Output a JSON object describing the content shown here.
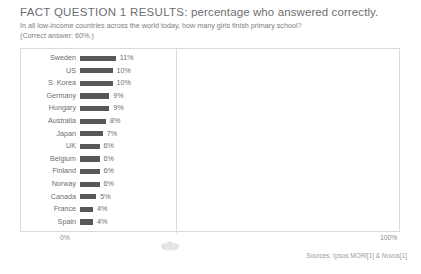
{
  "header": {
    "title_strong": "FACT QUESTION 1 RESULTS:",
    "title_rest": " percentage who answered correctly.",
    "subtitle": "In all low-income countries across the world today, how many girls finish primary school?",
    "note": "(Correct answer: 60%.)"
  },
  "axis": {
    "left_label": "0%",
    "right_label": "100%"
  },
  "footer": {
    "source": "Sources: Ipsos MORI[1] & Novus[1]"
  },
  "icons": {
    "watermark": "globe-watermark-icon"
  },
  "colors": {
    "bar": "#58585a",
    "frame": "#d9d9d9",
    "text": "#6d6e71"
  },
  "chart_data": {
    "type": "bar",
    "title": "FACT QUESTION 1 RESULTS: percentage who answered correctly.",
    "subtitle": "In all low-income countries across the world today, how many girls finish primary school?",
    "annotation": "(Correct answer: 60%.)",
    "orientation": "horizontal",
    "xlabel": "",
    "ylabel": "",
    "xlim": [
      0,
      100
    ],
    "xticks": [
      0,
      100
    ],
    "xticklabels": [
      "0%",
      "100%"
    ],
    "grid": false,
    "legend": null,
    "categories": [
      "Sweden",
      "US",
      "S. Korea",
      "Germany",
      "Hungary",
      "Australia",
      "Japan",
      "UK",
      "Belgium",
      "Finland",
      "Norway",
      "Canada",
      "France",
      "Spain"
    ],
    "values": [
      11,
      10,
      10,
      9,
      9,
      8,
      7,
      6,
      6,
      6,
      6,
      5,
      4,
      4
    ],
    "value_labels": [
      "11%",
      "10%",
      "10%",
      "9%",
      "9%",
      "8%",
      "7%",
      "6%",
      "6%",
      "6%",
      "6%",
      "5%",
      "4%",
      "4%"
    ],
    "source": "Sources: Ipsos MORI[1] & Novus[1]"
  }
}
